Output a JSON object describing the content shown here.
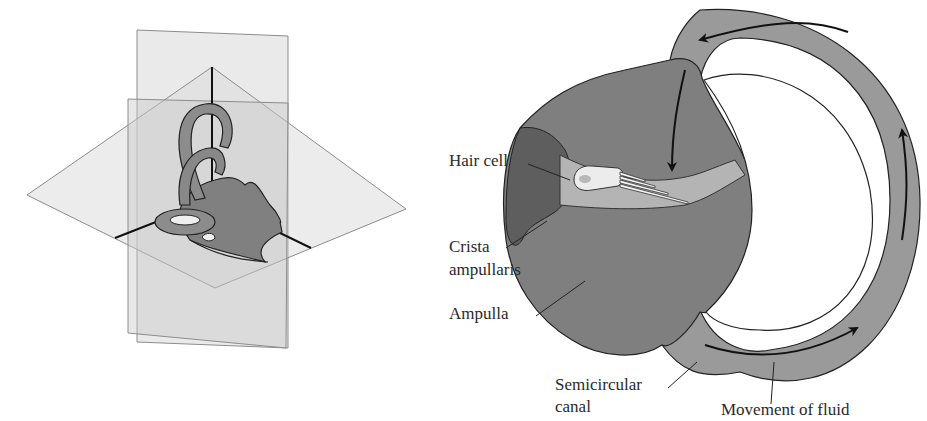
{
  "figure": {
    "left_panel": {
      "description": "Inner ear labyrinth shown within three orthogonal planes"
    },
    "right_panel": {
      "labels": {
        "hair_cell": "Hair cell",
        "crista_line1": "Crista",
        "crista_line2": "ampullaris",
        "ampulla": "Ampulla",
        "canal_line1": "Semicircular",
        "canal_line2": "canal",
        "fluid": "Movement of fluid"
      }
    },
    "colors": {
      "canal": "#9a9a9a",
      "ampulla": "#7f7f7f",
      "crista": "#5e5e5e",
      "cupula": "#b4b4b4",
      "hair_cell": "#ececec",
      "plane": "#d9d9d9",
      "plane_edge": "#8c8c8c"
    }
  }
}
